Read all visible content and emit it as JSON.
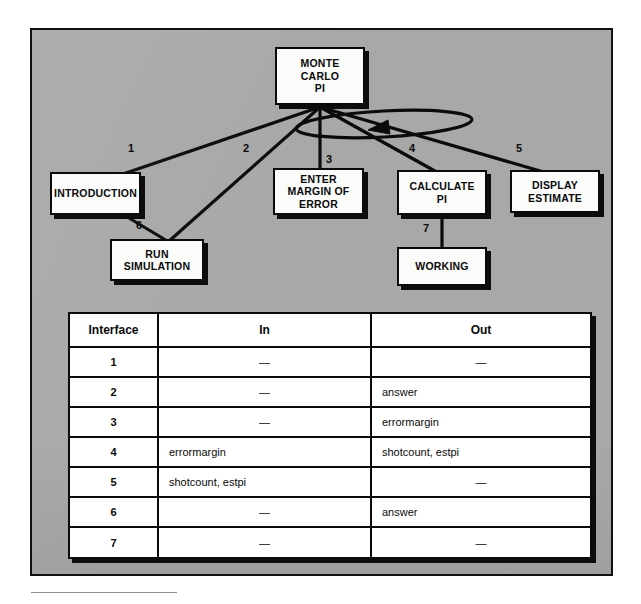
{
  "figure": {
    "background_color": "#ffffff",
    "panel_color": "#a8a8a8",
    "box_fill": "#fbfbfa",
    "ink_color": "#0b0b0b"
  },
  "diagram": {
    "type": "structure-chart",
    "root": {
      "id": "root",
      "label": "MONTE\nCARLO\nPI"
    },
    "nodes": [
      {
        "id": "introduction",
        "label": "INTRODUCTION"
      },
      {
        "id": "run-simulation",
        "label": "RUN\nSIMULATION"
      },
      {
        "id": "enter-margin",
        "label": "ENTER\nMARGIN OF\nERROR"
      },
      {
        "id": "calculate-pi",
        "label": "CALCULATE\nPI"
      },
      {
        "id": "display-estimate",
        "label": "DISPLAY\nESTIMATE"
      },
      {
        "id": "working",
        "label": "WORKING"
      }
    ],
    "interface_numbers": [
      "1",
      "2",
      "3",
      "4",
      "5",
      "6",
      "7"
    ],
    "loop_symbol": "iteration-loop-ellipse-with-arrowhead"
  },
  "table": {
    "columns": [
      "Interface",
      "In",
      "Out"
    ],
    "rows": [
      {
        "interface": "1",
        "in": "—",
        "out": "—"
      },
      {
        "interface": "2",
        "in": "—",
        "out": "answer"
      },
      {
        "interface": "3",
        "in": "—",
        "out": "errormargin"
      },
      {
        "interface": "4",
        "in": "errormargin",
        "out": "shotcount, estpi"
      },
      {
        "interface": "5",
        "in": "shotcount, estpi",
        "out": "—"
      },
      {
        "interface": "6",
        "in": "—",
        "out": "answer"
      },
      {
        "interface": "7",
        "in": "—",
        "out": "—"
      }
    ]
  }
}
